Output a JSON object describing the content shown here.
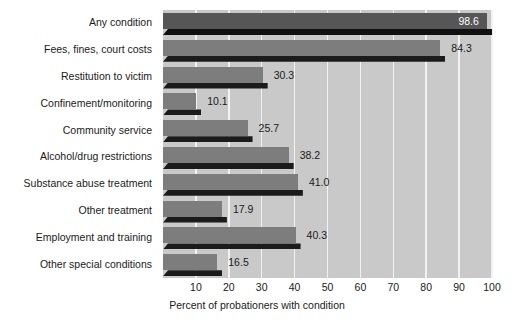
{
  "chart_data": {
    "type": "bar",
    "orientation": "horizontal",
    "title": "",
    "xlabel": "Percent of probationers with condition",
    "ylabel": "",
    "xlim": [
      0,
      100
    ],
    "xticks": [
      10,
      20,
      30,
      40,
      50,
      60,
      70,
      80,
      90,
      100
    ],
    "grid": true,
    "legend": "none",
    "categories": [
      "Any condition",
      "Fees, fines, court costs",
      "Restitution to victim",
      "Confinement/monitoring",
      "Community service",
      "Alcohol/drug restrictions",
      "Substance abuse treatment",
      "Other treatment",
      "Employment and training",
      "Other special conditions"
    ],
    "values": [
      98.6,
      84.3,
      30.3,
      10.1,
      25.7,
      38.2,
      41.0,
      17.9,
      40.3,
      16.5
    ],
    "value_labels": [
      "98.6",
      "84.3",
      "30.3",
      "10.1",
      "25.7",
      "38.2",
      "41.0",
      "17.9",
      "40.3",
      "16.5"
    ],
    "label_placement": [
      "inside",
      "outside",
      "outside",
      "outside",
      "outside",
      "outside",
      "outside",
      "outside",
      "outside",
      "outside"
    ],
    "colors": {
      "plot_background": "#c9c9c9",
      "gridline": "#f2f2f2",
      "bar_face": "#7d7d7d",
      "bar_face_highlight": "#565656",
      "bar_shadow": "#1b1b1b",
      "text": "#1a1a1a",
      "label_inside_text": "#ffffff",
      "page_background": "#ffffff"
    }
  }
}
